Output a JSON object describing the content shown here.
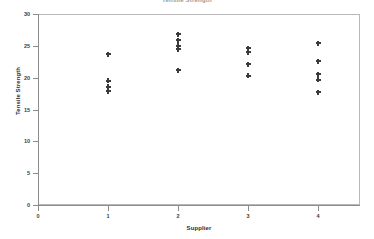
{
  "chart_data": {
    "type": "scatter",
    "title": "Tensile Strength",
    "xlabel": "Supplier",
    "ylabel": "Tensile Strength",
    "xlim": [
      0,
      4.6
    ],
    "ylim": [
      0,
      30
    ],
    "xticks": [
      0,
      1,
      2,
      3,
      4
    ],
    "xtick_labels": [
      "0",
      "1",
      "2",
      "3",
      "4"
    ],
    "yticks": [
      0,
      5,
      10,
      15,
      20,
      25,
      30
    ],
    "ytick_labels": [
      "0",
      "5",
      "10",
      "15",
      "20",
      "25",
      "30"
    ],
    "grid": false,
    "legend": false,
    "marker_style": "plus",
    "marker_color": "#3b3b3b",
    "frame_color": "#b9b9b9",
    "points": [
      {
        "x": 1,
        "y": 23.7
      },
      {
        "x": 1,
        "y": 19.5
      },
      {
        "x": 1,
        "y": 18.6
      },
      {
        "x": 1,
        "y": 17.9
      },
      {
        "x": 2,
        "y": 26.8
      },
      {
        "x": 2,
        "y": 25.9
      },
      {
        "x": 2,
        "y": 25.0
      },
      {
        "x": 2,
        "y": 24.5
      },
      {
        "x": 2,
        "y": 21.2
      },
      {
        "x": 3,
        "y": 24.6
      },
      {
        "x": 3,
        "y": 24.0
      },
      {
        "x": 3,
        "y": 22.1
      },
      {
        "x": 3,
        "y": 20.3
      },
      {
        "x": 4,
        "y": 25.4
      },
      {
        "x": 4,
        "y": 22.6
      },
      {
        "x": 4,
        "y": 20.5
      },
      {
        "x": 4,
        "y": 19.7
      },
      {
        "x": 4,
        "y": 17.7
      }
    ],
    "groups": [
      {
        "supplier": "1",
        "values": [
          23.7,
          19.5,
          18.6,
          17.9
        ]
      },
      {
        "supplier": "2",
        "values": [
          26.8,
          25.9,
          25.0,
          24.5,
          21.2
        ]
      },
      {
        "supplier": "3",
        "values": [
          24.6,
          24.0,
          22.1,
          20.3
        ]
      },
      {
        "supplier": "4",
        "values": [
          25.4,
          22.6,
          20.5,
          19.7,
          17.7
        ]
      }
    ]
  }
}
